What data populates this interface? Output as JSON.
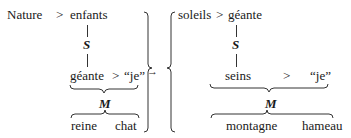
{
  "left": {
    "top_row": {
      "a": "Nature",
      "op": ">",
      "b": "enfants"
    },
    "s_label": "S",
    "mid_row": {
      "a": "géante",
      "op": ">",
      "b": "“je”"
    },
    "m_label": "M",
    "bottom_row": {
      "a": "reine",
      "b": "chat"
    }
  },
  "arrow": "→",
  "right": {
    "top_row": {
      "a": "soleils",
      "op": ">",
      "b": "géante"
    },
    "s_label": "S",
    "mid_row": {
      "a": "seins",
      "op": ">",
      "b": "“je”"
    },
    "m_label": "M",
    "bottom_row": {
      "a": "montagne",
      "b": "hameau"
    }
  }
}
